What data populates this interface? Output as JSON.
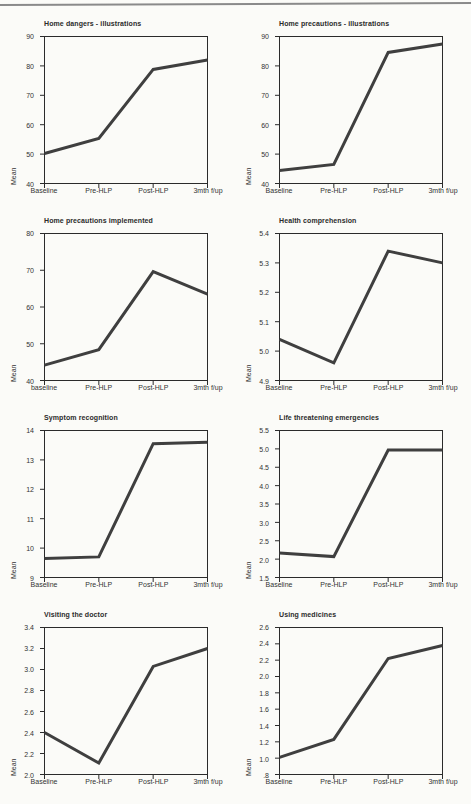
{
  "page": {
    "line_color": "#3f3f3f",
    "frame_color": "#2b2b2b",
    "text_color": "#333333",
    "top_rule_color": "#8a8a8a"
  },
  "chart_data": [
    {
      "type": "line",
      "title": "Home dangers - illustrations",
      "ylabel": "Mean",
      "categories": [
        "Baseline",
        "Pre-HLP",
        "Post-HLP",
        "3mth f/up"
      ],
      "values": [
        50.2,
        55.3,
        78.8,
        82.0
      ],
      "ylim": [
        40,
        90
      ],
      "yticks": [
        "40",
        "50",
        "60",
        "70",
        "80",
        "90"
      ],
      "grid": false,
      "legend": "none"
    },
    {
      "type": "line",
      "title": "Home precautions - illustrations",
      "ylabel": "Mean",
      "categories": [
        "Baseline",
        "Pre-HLP",
        "Post-HLP",
        "3mth f/up"
      ],
      "values": [
        44.4,
        46.5,
        84.6,
        87.5
      ],
      "ylim": [
        40,
        90
      ],
      "yticks": [
        "40",
        "50",
        "60",
        "70",
        "80",
        "90"
      ],
      "grid": false,
      "legend": "none"
    },
    {
      "type": "line",
      "title": "Home precautions implemented",
      "ylabel": "Mean",
      "categories": [
        "baseline",
        "Pre-HLP",
        "Post-HLP",
        "3mth f/up"
      ],
      "values": [
        44.2,
        48.4,
        69.6,
        63.5
      ],
      "ylim": [
        40,
        80
      ],
      "yticks": [
        "40",
        "50",
        "60",
        "70",
        "80"
      ],
      "grid": false,
      "legend": "none"
    },
    {
      "type": "line",
      "title": "Health comprehension",
      "ylabel": "Mean",
      "categories": [
        "Baseline",
        "Pre-HLP",
        "Post-HLP",
        "3mth f/up"
      ],
      "values": [
        5.04,
        4.96,
        5.34,
        5.3
      ],
      "ylim": [
        4.9,
        5.4
      ],
      "yticks": [
        "4.9",
        "5.0",
        "5.1",
        "5.2",
        "5.3",
        "5.4"
      ],
      "grid": false,
      "legend": "none"
    },
    {
      "type": "line",
      "title": "Symptom recognition",
      "ylabel": "Mean",
      "categories": [
        "Baseline",
        "Pre-HLP",
        "Post-HLP",
        "3mth f/up"
      ],
      "values": [
        9.65,
        9.7,
        13.55,
        13.6
      ],
      "ylim": [
        9,
        14
      ],
      "yticks": [
        "9",
        "10",
        "11",
        "12",
        "13",
        "14"
      ],
      "grid": false,
      "legend": "none"
    },
    {
      "type": "line",
      "title": "Life threatening emergencies",
      "ylabel": "Mean",
      "categories": [
        "Baseline",
        "Pre-HLP",
        "Post-HLP",
        "3mth f/up"
      ],
      "values": [
        2.17,
        2.07,
        4.97,
        4.97
      ],
      "ylim": [
        1.5,
        5.5
      ],
      "yticks": [
        "1.5",
        "2.0",
        "2.5",
        "3.0",
        "3.5",
        "4.0",
        "4.5",
        "5.0",
        "5.5"
      ],
      "grid": false,
      "legend": "none"
    },
    {
      "type": "line",
      "title": "Visiting the doctor",
      "ylabel": "Mean",
      "categories": [
        "Baseline",
        "Pre-HLP",
        "Post-HLP",
        "3mth f/up"
      ],
      "values": [
        2.4,
        2.11,
        3.03,
        3.2
      ],
      "ylim": [
        2.0,
        3.4
      ],
      "yticks": [
        "2.0",
        "2.2",
        "2.4",
        "2.6",
        "2.8",
        "3.0",
        "3.2",
        "3.4"
      ],
      "grid": false,
      "legend": "none"
    },
    {
      "type": "line",
      "title": "Using medicines",
      "ylabel": "Mean",
      "categories": [
        "Baseline",
        "Pre-HLP",
        "Post-HLP",
        "3mth f/up"
      ],
      "values": [
        1.01,
        1.23,
        2.22,
        2.38
      ],
      "ylim": [
        0.8,
        2.6
      ],
      "yticks": [
        ".8",
        "1.0",
        "1.2",
        "1.4",
        "1.6",
        "1.8",
        "2.0",
        "2.2",
        "2.4",
        "2.6"
      ],
      "grid": false,
      "legend": "none"
    }
  ]
}
